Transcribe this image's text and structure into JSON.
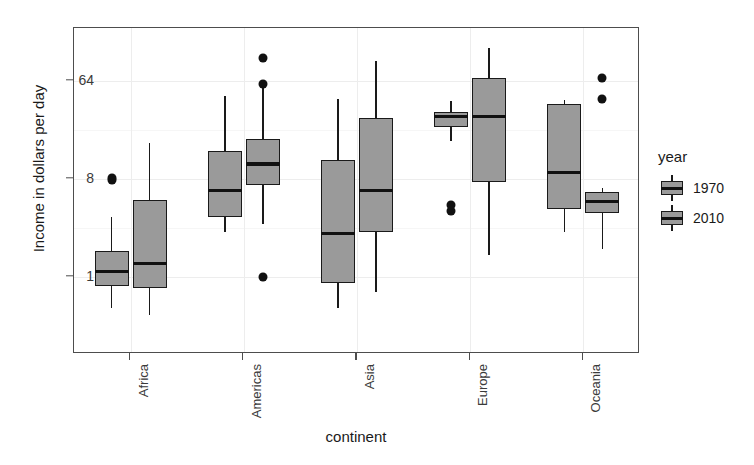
{
  "chart_data": {
    "type": "boxplot",
    "title": "",
    "xlabel": "continent",
    "ylabel": "Income in dollars per day",
    "categories": [
      "Africa",
      "Americas",
      "Asia",
      "Europe",
      "Oceania"
    ],
    "legend_title": "year",
    "legend_position": "right",
    "grid": true,
    "y_scale": "log2",
    "y_tick_labels": [
      "1",
      "8",
      "64"
    ],
    "y_tick_values": [
      1,
      8,
      64
    ],
    "ylim": [
      0.33,
      145
    ],
    "series": [
      {
        "name": "1970",
        "fill": "#9a9a9a",
        "boxes": [
          {
            "category": "Africa",
            "whisker_low": 0.52,
            "q1": 0.82,
            "median": 1.12,
            "q3": 1.75,
            "whisker_high": 3.6,
            "outliers": [
              7.8,
              8.1
            ]
          },
          {
            "category": "Americas",
            "whisker_low": 2.6,
            "q1": 3.6,
            "median": 6.3,
            "q3": 14.5,
            "whisker_high": 47.0,
            "outliers": []
          },
          {
            "category": "Asia",
            "whisker_low": 0.52,
            "q1": 0.88,
            "median": 2.5,
            "q3": 12.0,
            "whisker_high": 44.0,
            "outliers": []
          },
          {
            "category": "Europe",
            "whisker_low": 18.0,
            "q1": 24.0,
            "median": 30.0,
            "q3": 33.0,
            "whisker_high": 42.0,
            "outliers": [
              4.1,
              4.6
            ]
          },
          {
            "category": "Oceania",
            "whisker_low": 2.6,
            "q1": 4.2,
            "median": 9.2,
            "q3": 39.0,
            "whisker_high": 43.0,
            "outliers": []
          }
        ]
      },
      {
        "name": "2010",
        "fill": "#9a9a9a",
        "boxes": [
          {
            "category": "Africa",
            "whisker_low": 0.45,
            "q1": 0.8,
            "median": 1.33,
            "q3": 5.1,
            "whisker_high": 17.0,
            "outliers": []
          },
          {
            "category": "Americas",
            "whisker_low": 3.1,
            "q1": 7.0,
            "median": 11.0,
            "q3": 18.5,
            "whisker_high": 55.0,
            "outliers": [
              1.0,
              60.0,
              105.0
            ]
          },
          {
            "category": "Asia",
            "whisker_low": 0.72,
            "q1": 2.6,
            "median": 6.3,
            "q3": 29.0,
            "whisker_high": 98.0,
            "outliers": []
          },
          {
            "category": "Europe",
            "whisker_low": 1.6,
            "q1": 7.5,
            "median": 30.0,
            "q3": 68.0,
            "whisker_high": 130.0,
            "outliers": []
          },
          {
            "category": "Oceania",
            "whisker_low": 1.8,
            "q1": 3.9,
            "median": 5.0,
            "q3": 6.1,
            "whisker_high": 6.6,
            "outliers": [
              44.0,
              68.0
            ]
          }
        ]
      }
    ]
  },
  "axes": {
    "y_title": "Income in dollars per day",
    "x_title": "continent"
  },
  "legend": {
    "title": "year",
    "items": [
      {
        "label": "1970"
      },
      {
        "label": "2010"
      }
    ]
  }
}
